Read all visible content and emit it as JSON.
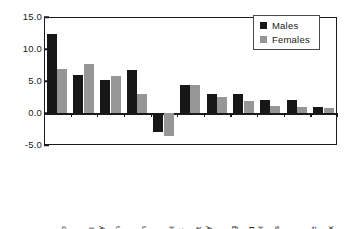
{
  "chart_data": {
    "type": "bar",
    "title": "",
    "subtitle": "",
    "xlabel": "",
    "ylabel": "",
    "ylim": [
      -5.0,
      15.0
    ],
    "yticks": [
      -5.0,
      0.0,
      5.0,
      10.0,
      15.0
    ],
    "ytick_labels": [
      "-5.0",
      "0.0",
      "5.0",
      "10.0",
      "15.0"
    ],
    "grid": false,
    "legend_position": "top-right",
    "categories": [
      "Tobacco",
      "Physical inactivity",
      "Hypertension",
      "Alcohol harm",
      "Alcohol benefit",
      "Overweight and obesity",
      "Lack of fruit/veg",
      "High blood cholesterol",
      "Illicit drugs",
      "Occupational illness/disease",
      "Unsafe sex"
    ],
    "category_lines": [
      [
        "Tobacco"
      ],
      [
        "Physical",
        "inactivity"
      ],
      [
        "Hypertension"
      ],
      [
        "Alcohol harm"
      ],
      [
        "Alcohol",
        "benefit"
      ],
      [
        "Overweight",
        "and obesity"
      ],
      [
        "Lack of",
        "fruit/veg"
      ],
      [
        "High blood",
        "cholesterol"
      ],
      [
        "Illicit drugs"
      ],
      [
        "Occupational",
        "illness/disease"
      ],
      [
        "Unsafe sex"
      ]
    ],
    "series": [
      {
        "name": "Males",
        "color": "#171717",
        "values": [
          12.3,
          6.0,
          5.1,
          6.7,
          -3.0,
          4.3,
          3.0,
          2.9,
          2.0,
          2.1,
          0.9
        ]
      },
      {
        "name": "Females",
        "color": "#969696",
        "values": [
          6.8,
          7.6,
          5.8,
          3.0,
          -3.6,
          4.3,
          2.5,
          1.9,
          1.1,
          0.9,
          0.8
        ]
      }
    ]
  },
  "legend": {
    "items": [
      {
        "label": "Males",
        "color": "#171717"
      },
      {
        "label": "Females",
        "color": "#969696"
      }
    ]
  }
}
